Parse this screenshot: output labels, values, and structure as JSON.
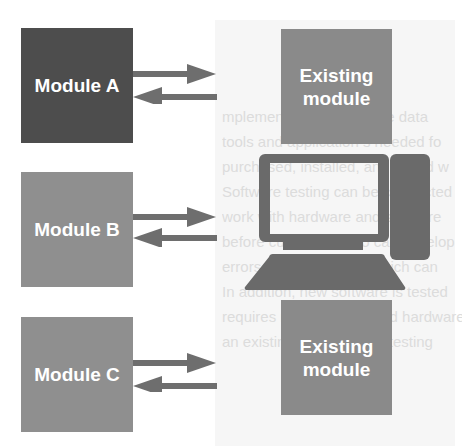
{
  "diagram": {
    "title": "",
    "colors": {
      "module_a": "#4d4d4d",
      "module_b": "#8f8f8f",
      "module_c": "#8f8f8f",
      "existing_module": "#8a8a8a",
      "arrow": "#6e6e6e",
      "computer": "#6a6a6a",
      "panel_background": "#f6f6f6",
      "text": "#ffffff"
    },
    "modules": [
      {
        "id": "module-a",
        "label": "Module A"
      },
      {
        "id": "module-b",
        "label": "Module B"
      },
      {
        "id": "module-c",
        "label": "Module C"
      }
    ],
    "targets": [
      {
        "id": "existing-module-top",
        "label_line1": "Existing",
        "label_line2": "module"
      },
      {
        "id": "computer",
        "icon": "desktop-computer-icon"
      },
      {
        "id": "existing-module-bottom",
        "label_line1": "Existing",
        "label_line2": "module"
      }
    ],
    "connections": [
      {
        "from": "Module A",
        "to": "Existing module",
        "direction": "bidirectional"
      },
      {
        "from": "Module B",
        "to": "Computer",
        "direction": "bidirectional"
      },
      {
        "from": "Module C",
        "to": "Existing module",
        "direction": "bidirectional"
      }
    ],
    "background_ghost_text": [
      "mplementation phase, the data",
      "tools and application s needed fo",
      "purchased, installed, and tested w",
      "Software testing can be conducted",
      "work with hardware and software",
      "before customers who can develop",
      "errors in the software, which can",
      "In addition, new software is tested",
      "requires new software and hardware",
      "an existing environment, testing"
    ]
  }
}
